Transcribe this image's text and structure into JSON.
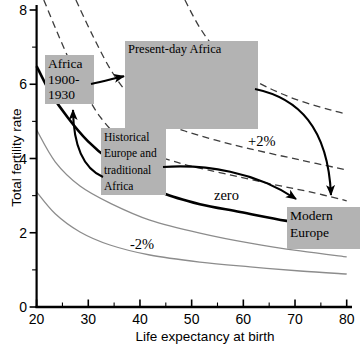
{
  "figure": {
    "x_axis": {
      "label": "Life expectancy at birth",
      "ticks": [
        20,
        30,
        40,
        50,
        60,
        70,
        80
      ],
      "minor_ticks": [
        25,
        35,
        45,
        55,
        65,
        75
      ],
      "range": [
        20,
        80
      ]
    },
    "y_axis": {
      "label": "Total fertility rate",
      "ticks": [
        0,
        2,
        4,
        6,
        8
      ],
      "minor_ticks": [
        1,
        3,
        5,
        7
      ],
      "range": [
        0,
        8
      ]
    }
  },
  "chart_data": {
    "type": "line",
    "title": "",
    "xlabel": "Life expectancy at birth",
    "ylabel": "Total fertility rate",
    "xlim": [
      20,
      80
    ],
    "ylim": [
      0,
      8
    ],
    "grid": false,
    "series": [
      {
        "name": "isogrowth-plus3pct",
        "label": "",
        "style": "dashed",
        "points": [
          [
            48.7,
            8.27
          ],
          [
            51.6,
            7.52
          ],
          [
            55.1,
            6.87
          ],
          [
            59.4,
            6.33
          ],
          [
            64.2,
            5.95
          ],
          [
            70.0,
            5.6
          ],
          [
            76.8,
            5.31
          ],
          [
            80,
            5.2
          ]
        ]
      },
      {
        "name": "isogrowth-plus2pct",
        "label": "+2%",
        "style": "dashed",
        "points": [
          [
            27.6,
            8.27
          ],
          [
            30.9,
            7.3
          ],
          [
            34.6,
            6.33
          ],
          [
            38.7,
            5.58
          ],
          [
            43.5,
            5.01
          ],
          [
            48.7,
            4.74
          ],
          [
            54.5,
            4.5
          ],
          [
            61.3,
            4.26
          ],
          [
            71.0,
            3.96
          ],
          [
            80,
            3.69
          ]
        ]
      },
      {
        "name": "isogrowth-plus1pct",
        "label": "",
        "style": "dashed",
        "points": [
          [
            21.4,
            8.27
          ],
          [
            23.8,
            7.46
          ],
          [
            26.5,
            6.6
          ],
          [
            29.4,
            5.79
          ],
          [
            32.3,
            5.12
          ],
          [
            36.1,
            4.55
          ],
          [
            40.4,
            4.2
          ],
          [
            44.5,
            4.01
          ],
          [
            49.7,
            3.8
          ],
          [
            56.8,
            3.58
          ],
          [
            65.5,
            3.31
          ],
          [
            72.9,
            3.1
          ],
          [
            80,
            2.86
          ]
        ]
      },
      {
        "name": "isogrowth-zero",
        "label": "zero",
        "style": "thick-solid",
        "points": [
          [
            20,
            6.49
          ],
          [
            22.6,
            5.79
          ],
          [
            26.1,
            5.09
          ],
          [
            29.9,
            4.47
          ],
          [
            34.2,
            3.96
          ],
          [
            40.0,
            3.47
          ],
          [
            44.5,
            3.07
          ],
          [
            51.6,
            2.77
          ],
          [
            59.4,
            2.56
          ],
          [
            68.4,
            2.32
          ],
          [
            80,
            2.1
          ]
        ]
      },
      {
        "name": "isogrowth-minus1pct",
        "label": "",
        "style": "thin-solid",
        "points": [
          [
            20,
            4.77
          ],
          [
            23.6,
            3.91
          ],
          [
            28.4,
            3.26
          ],
          [
            34.2,
            2.8
          ],
          [
            41.9,
            2.34
          ],
          [
            51.6,
            1.99
          ],
          [
            61.3,
            1.72
          ],
          [
            71.0,
            1.51
          ],
          [
            80,
            1.35
          ]
        ]
      },
      {
        "name": "isogrowth-minus2pct",
        "label": "-2%",
        "style": "thin-solid",
        "points": [
          [
            20,
            3.1
          ],
          [
            23.6,
            2.51
          ],
          [
            28.4,
            2.02
          ],
          [
            34.2,
            1.67
          ],
          [
            41.9,
            1.4
          ],
          [
            51.6,
            1.21
          ],
          [
            61.3,
            1.08
          ],
          [
            71.0,
            0.97
          ],
          [
            80,
            0.89
          ]
        ]
      }
    ],
    "annotations": {
      "boxes": [
        {
          "id": "africa-1900-1930",
          "lines": [
            "Africa",
            "1900-",
            "1930"
          ]
        },
        {
          "id": "present-day-africa",
          "lines": [
            "Present-day Africa"
          ]
        },
        {
          "id": "historical-europe",
          "lines": [
            "Historical",
            "Europe and",
            "traditional",
            "Africa"
          ]
        },
        {
          "id": "modern-europe",
          "lines": [
            "Modern",
            "Europe"
          ]
        }
      ],
      "curve_labels": [
        {
          "text": "+2%"
        },
        {
          "text": "zero"
        },
        {
          "text": "-2%"
        }
      ],
      "arrows": [
        {
          "from": "africa-1900-1930",
          "to": "present-day-africa"
        },
        {
          "from": "historical-europe",
          "to": "africa-1900-1930"
        },
        {
          "from": "historical-europe",
          "to": "modern-europe"
        },
        {
          "from": "present-day-africa",
          "to": "modern-europe"
        }
      ]
    },
    "colors": {
      "axis": "#000000",
      "thick_line": "#000000",
      "thin_line": "#8c8c8c",
      "dashed_line": "#3d3d3d",
      "box_fill": "#b3b3b3",
      "arrow": "#000000"
    }
  }
}
